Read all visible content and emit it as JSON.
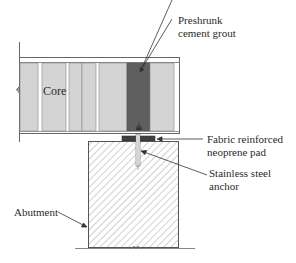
{
  "diagram": {
    "type": "bridge-bearing-detail",
    "colors": {
      "core_fill": "#d4d4d4",
      "grout_fill": "#5f5f5f",
      "pad_fill": "#3f3f3f",
      "outline": "#555555",
      "hatch": "#8a8a8a",
      "text": "#2a2a2a"
    },
    "labels": {
      "core": "Core",
      "grout_line1": "Preshrunk",
      "grout_line2": "cement grout",
      "pad_line1": "Fabric reinforced",
      "pad_line2": "neoprene pad",
      "anchor_line1": "Stainless steel",
      "anchor_line2": "anchor",
      "abutment": "Abutment"
    }
  }
}
